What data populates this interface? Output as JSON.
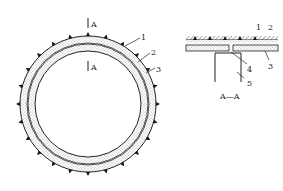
{
  "diagram": {
    "main_view": {
      "section_marker_top": "A",
      "section_marker_bottom": "A",
      "callouts": [
        "1",
        "2",
        "3"
      ]
    },
    "section_view": {
      "caption": "A—A",
      "callouts_top": [
        "1",
        "2"
      ],
      "callouts_side": [
        "3",
        "4",
        "5"
      ]
    },
    "colors": {
      "line": "#222222",
      "fill": "#d8d8d8",
      "background": "#ffffff"
    }
  }
}
